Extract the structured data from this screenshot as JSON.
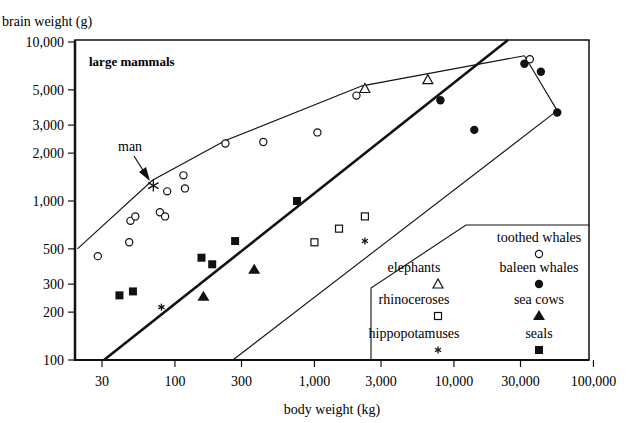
{
  "chart_data": {
    "type": "scatter",
    "title": "large mammals",
    "xlabel": "body weight (kg)",
    "ylabel": "brain weight (g)",
    "xscale": "log",
    "yscale": "log",
    "xlim": [
      20,
      100000
    ],
    "ylim": [
      100,
      10000
    ],
    "grid": false,
    "x_ticks": [
      30,
      100,
      300,
      1000,
      3000,
      10000,
      30000,
      100000
    ],
    "x_tick_labels": [
      "30",
      "100",
      "300",
      "1,000",
      "3,000",
      "10,000",
      "30,000",
      "100,000"
    ],
    "y_ticks": [
      100,
      200,
      300,
      500,
      1000,
      2000,
      3000,
      5000,
      10000
    ],
    "y_tick_labels": [
      "100",
      "200",
      "300",
      "500",
      "1,000",
      "2,000",
      "3,000",
      "5,000",
      "10,000"
    ],
    "legend_position": "lower right",
    "series": [
      {
        "name": "toothed whales",
        "marker": "open-circle",
        "points": [
          [
            28,
            450
          ],
          [
            47,
            550
          ],
          [
            48,
            750
          ],
          [
            52,
            800
          ],
          [
            78,
            850
          ],
          [
            85,
            800
          ],
          [
            88,
            1150
          ],
          [
            115,
            1450
          ],
          [
            118,
            1200
          ],
          [
            230,
            2300
          ],
          [
            430,
            2350
          ],
          [
            1050,
            2700
          ],
          [
            2000,
            4600
          ],
          [
            35000,
            7800
          ]
        ]
      },
      {
        "name": "baleen whales",
        "marker": "filled-circle",
        "points": [
          [
            8000,
            4300
          ],
          [
            14000,
            2800
          ],
          [
            32000,
            7300
          ],
          [
            42000,
            6500
          ],
          [
            55000,
            3600
          ]
        ]
      },
      {
        "name": "elephants",
        "marker": "open-triangle",
        "points": [
          [
            2300,
            5100
          ],
          [
            6500,
            5800
          ]
        ]
      },
      {
        "name": "sea cows",
        "marker": "filled-triangle",
        "points": [
          [
            160,
            250
          ],
          [
            370,
            370
          ]
        ]
      },
      {
        "name": "rhinoceroses",
        "marker": "open-square",
        "points": [
          [
            1000,
            550
          ],
          [
            1500,
            670
          ],
          [
            2300,
            800
          ]
        ]
      },
      {
        "name": "hippopotamuses",
        "marker": "asterisk",
        "points": [
          [
            80,
            215
          ],
          [
            2300,
            560
          ]
        ]
      },
      {
        "name": "seals",
        "marker": "filled-square",
        "points": [
          [
            40,
            255
          ],
          [
            50,
            270
          ],
          [
            155,
            440
          ],
          [
            185,
            400
          ],
          [
            270,
            560
          ],
          [
            750,
            1000
          ]
        ]
      },
      {
        "name": "man",
        "marker": "asterisk-large",
        "points": [
          [
            70,
            1250
          ]
        ]
      }
    ],
    "regression_line": {
      "from": [
        31,
        100
      ],
      "to": [
        47000,
        10000
      ]
    },
    "envelope_upper": [
      [
        20,
        500
      ],
      [
        69,
        1350
      ],
      [
        230,
        2400
      ],
      [
        2200,
        5300
      ],
      [
        32000,
        8200
      ]
    ],
    "envelope_right": [
      [
        32000,
        8200
      ],
      [
        55000,
        3700
      ]
    ],
    "envelope_lower": [
      [
        55000,
        3700
      ],
      [
        260,
        100
      ]
    ],
    "annotations": [
      {
        "text": "man",
        "target": [
          70,
          1250
        ]
      }
    ]
  },
  "labels": {
    "ylabel": "brain weight (g)",
    "xlabel": "body weight (kg)",
    "title": "large mammals",
    "man": "man"
  },
  "legend": [
    {
      "label": "toothed whales",
      "marker": "open-circle",
      "col": 1,
      "row": 0
    },
    {
      "label": "elephants",
      "marker": "open-triangle",
      "col": 0,
      "row": 1
    },
    {
      "label": "baleen whales",
      "marker": "filled-circle",
      "col": 1,
      "row": 1
    },
    {
      "label": "rhinoceroses",
      "marker": "open-square",
      "col": 0,
      "row": 2
    },
    {
      "label": "sea cows",
      "marker": "filled-triangle",
      "col": 1,
      "row": 2
    },
    {
      "label": "hippopotamuses",
      "marker": "asterisk",
      "col": 0,
      "row": 3
    },
    {
      "label": "seals",
      "marker": "filled-square",
      "col": 1,
      "row": 3
    }
  ]
}
